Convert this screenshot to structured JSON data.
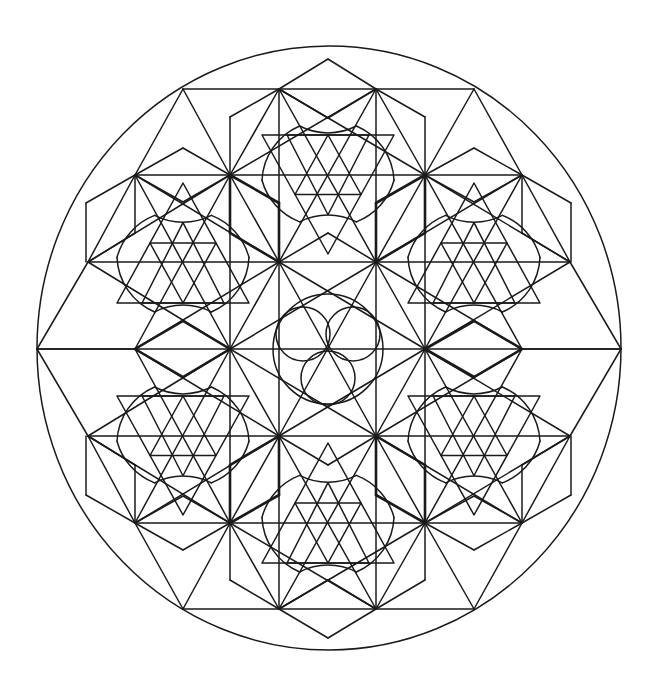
{
  "title": "Geometric mandala line art",
  "colors": {
    "background": "#ffffff",
    "stroke": "#1a1a1a"
  },
  "stroke": {
    "thin": 1.5,
    "bold": 2.6
  },
  "outer_ellipse": {
    "cx": 329,
    "cy": 348,
    "rx": 292,
    "ry": 302
  },
  "center": {
    "x": 328,
    "y": 349
  },
  "central_circles": {
    "big": {
      "cx": 328,
      "cy": 349,
      "r": 55
    },
    "small": [
      {
        "cx": 303,
        "cy": 334,
        "r": 27
      },
      {
        "cx": 353,
        "cy": 334,
        "r": 27
      },
      {
        "cx": 328,
        "cy": 378,
        "r": 27
      }
    ]
  },
  "grid_rows": [
    89,
    175,
    262,
    349,
    436,
    523,
    609
  ],
  "segments": [
    [
      183,
      89,
      474,
      89
    ],
    [
      183,
      609,
      474,
      609
    ],
    [
      135,
      175,
      522,
      175
    ],
    [
      135,
      523,
      522,
      523
    ],
    [
      88,
      262,
      570,
      262
    ],
    [
      88,
      436,
      570,
      436
    ],
    [
      37,
      349,
      621,
      349
    ],
    [
      230,
      117,
      230,
      580
    ],
    [
      425,
      117,
      425,
      580
    ],
    [
      279,
      89,
      279,
      609
    ],
    [
      376,
      89,
      376,
      609
    ],
    [
      135,
      175,
      135,
      233
    ],
    [
      135,
      465,
      135,
      523
    ],
    [
      522,
      175,
      522,
      233
    ],
    [
      522,
      465,
      522,
      523
    ],
    [
      86,
      203,
      86,
      262
    ],
    [
      86,
      436,
      86,
      495
    ],
    [
      571,
      203,
      571,
      262
    ],
    [
      571,
      436,
      571,
      495
    ],
    [
      183,
      89,
      135,
      175
    ],
    [
      183,
      89,
      230,
      175
    ],
    [
      474,
      89,
      425,
      175
    ],
    [
      474,
      89,
      522,
      175
    ],
    [
      183,
      609,
      135,
      523
    ],
    [
      183,
      609,
      230,
      523
    ],
    [
      474,
      609,
      425,
      523
    ],
    [
      474,
      609,
      522,
      523
    ],
    [
      135,
      175,
      88,
      262
    ],
    [
      522,
      175,
      570,
      262
    ],
    [
      135,
      523,
      88,
      436
    ],
    [
      522,
      523,
      570,
      436
    ],
    [
      88,
      262,
      37,
      349
    ],
    [
      570,
      262,
      621,
      349
    ],
    [
      88,
      436,
      37,
      349
    ],
    [
      570,
      436,
      621,
      349
    ],
    [
      37,
      349,
      135,
      349
    ],
    [
      621,
      349,
      522,
      349
    ],
    [
      279,
      89,
      230,
      175
    ],
    [
      376,
      89,
      425,
      175
    ],
    [
      279,
      609,
      230,
      523
    ],
    [
      376,
      609,
      425,
      523
    ],
    [
      279,
      89,
      376,
      262
    ],
    [
      376,
      89,
      279,
      262
    ],
    [
      279,
      609,
      376,
      436
    ],
    [
      376,
      609,
      279,
      436
    ],
    [
      230,
      175,
      279,
      262
    ],
    [
      425,
      175,
      376,
      262
    ],
    [
      230,
      523,
      279,
      436
    ],
    [
      425,
      523,
      376,
      436
    ],
    [
      230,
      175,
      135,
      349
    ],
    [
      425,
      175,
      522,
      349
    ],
    [
      230,
      523,
      135,
      349
    ],
    [
      425,
      523,
      522,
      349
    ],
    [
      135,
      175,
      230,
      349
    ],
    [
      522,
      175,
      425,
      349
    ],
    [
      135,
      523,
      230,
      349
    ],
    [
      522,
      523,
      425,
      349
    ],
    [
      88,
      262,
      230,
      349
    ],
    [
      570,
      262,
      425,
      349
    ],
    [
      88,
      436,
      230,
      349
    ],
    [
      570,
      436,
      425,
      349
    ],
    [
      135,
      349,
      279,
      262
    ],
    [
      522,
      349,
      376,
      262
    ],
    [
      135,
      349,
      279,
      436
    ],
    [
      522,
      349,
      376,
      436
    ],
    [
      230,
      349,
      279,
      262
    ],
    [
      425,
      349,
      376,
      262
    ],
    [
      230,
      349,
      279,
      436
    ],
    [
      425,
      349,
      376,
      436
    ],
    [
      279,
      262,
      425,
      349
    ],
    [
      376,
      262,
      230,
      349
    ],
    [
      279,
      436,
      425,
      349
    ],
    [
      376,
      436,
      230,
      349
    ],
    [
      279,
      262,
      376,
      436
    ],
    [
      376,
      262,
      279,
      436
    ],
    [
      230,
      175,
      88,
      262
    ],
    [
      425,
      175,
      570,
      262
    ],
    [
      230,
      523,
      88,
      436
    ],
    [
      425,
      523,
      570,
      436
    ],
    [
      279,
      89,
      425,
      175
    ],
    [
      376,
      89,
      230,
      175
    ],
    [
      279,
      609,
      425,
      523
    ],
    [
      376,
      609,
      230,
      523
    ],
    [
      135,
      175,
      279,
      262
    ],
    [
      522,
      175,
      376,
      262
    ],
    [
      135,
      523,
      279,
      436
    ],
    [
      522,
      523,
      376,
      436
    ],
    [
      135,
      175,
      183,
      148
    ],
    [
      183,
      148,
      230,
      175
    ],
    [
      425,
      175,
      474,
      148
    ],
    [
      474,
      148,
      522,
      175
    ],
    [
      135,
      523,
      183,
      550
    ],
    [
      183,
      550,
      230,
      523
    ],
    [
      425,
      523,
      474,
      550
    ],
    [
      474,
      550,
      522,
      523
    ],
    [
      279,
      89,
      328,
      59
    ],
    [
      328,
      59,
      376,
      89
    ],
    [
      279,
      609,
      328,
      638
    ],
    [
      328,
      638,
      376,
      609
    ],
    [
      230,
      117,
      279,
      89
    ],
    [
      425,
      117,
      376,
      89
    ],
    [
      230,
      580,
      279,
      609
    ],
    [
      425,
      580,
      376,
      609
    ],
    [
      135,
      175,
      86,
      203
    ],
    [
      522,
      175,
      571,
      203
    ],
    [
      135,
      523,
      86,
      495
    ],
    [
      522,
      523,
      571,
      495
    ],
    [
      135,
      233,
      88,
      262
    ],
    [
      522,
      233,
      570,
      262
    ],
    [
      135,
      465,
      88,
      436
    ],
    [
      522,
      465,
      570,
      436
    ],
    [
      230,
      175,
      183,
      202
    ],
    [
      183,
      202,
      135,
      175
    ],
    [
      425,
      175,
      474,
      202
    ],
    [
      474,
      202,
      522,
      175
    ],
    [
      230,
      523,
      183,
      496
    ],
    [
      183,
      496,
      135,
      523
    ],
    [
      425,
      523,
      474,
      496
    ],
    [
      474,
      496,
      522,
      523
    ],
    [
      279,
      89,
      328,
      118
    ],
    [
      328,
      118,
      376,
      89
    ],
    [
      279,
      609,
      328,
      580
    ],
    [
      328,
      580,
      376,
      609
    ],
    [
      279,
      262,
      328,
      233
    ],
    [
      328,
      233,
      376,
      262
    ],
    [
      279,
      436,
      328,
      465
    ],
    [
      328,
      465,
      376,
      436
    ]
  ],
  "bold_segments": [
    [
      230,
      175,
      279,
      203
    ],
    [
      279,
      203,
      279,
      262
    ],
    [
      230,
      175,
      230,
      233
    ],
    [
      230,
      233,
      279,
      262
    ],
    [
      425,
      175,
      376,
      203
    ],
    [
      376,
      203,
      376,
      262
    ],
    [
      425,
      175,
      425,
      233
    ],
    [
      425,
      233,
      376,
      262
    ],
    [
      230,
      523,
      279,
      495
    ],
    [
      279,
      495,
      279,
      436
    ],
    [
      230,
      523,
      230,
      465
    ],
    [
      230,
      465,
      279,
      436
    ],
    [
      425,
      523,
      376,
      495
    ],
    [
      376,
      495,
      376,
      436
    ],
    [
      425,
      523,
      425,
      465
    ],
    [
      425,
      465,
      376,
      436
    ],
    [
      135,
      349,
      183,
      321
    ],
    [
      183,
      321,
      230,
      349
    ],
    [
      135,
      349,
      183,
      377
    ],
    [
      183,
      377,
      230,
      349
    ],
    [
      425,
      349,
      474,
      321
    ],
    [
      474,
      321,
      522,
      349
    ],
    [
      425,
      349,
      474,
      377
    ],
    [
      474,
      377,
      522,
      349
    ]
  ],
  "stars": [
    {
      "name": "upper-left",
      "cx": 183,
      "apex": 183,
      "base": 303,
      "up": true
    },
    {
      "name": "upper-right",
      "cx": 474,
      "apex": 183,
      "base": 303,
      "up": true
    },
    {
      "name": "bottom-center",
      "cx": 328,
      "apex": 443,
      "base": 563,
      "up": true
    },
    {
      "name": "top-center",
      "cx": 328,
      "apex": 254,
      "base": 135,
      "up": false
    },
    {
      "name": "lower-left",
      "cx": 183,
      "apex": 515,
      "base": 396,
      "up": false
    },
    {
      "name": "lower-right",
      "cx": 474,
      "apex": 515,
      "base": 396,
      "up": false
    }
  ],
  "star_half_base": 66
}
